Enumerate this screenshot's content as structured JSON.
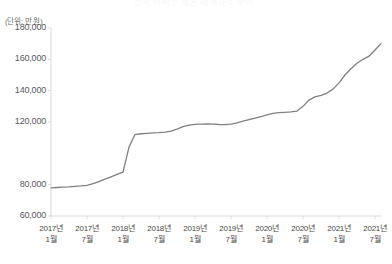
{
  "chart_data": {
    "type": "line",
    "title": "전국 아파트 평균 매매가격 추이",
    "unit_label": "(단위: 만 원)",
    "xlabel": "",
    "ylabel": "",
    "ylim": [
      60000,
      180000
    ],
    "yticks": [
      60000,
      80000,
      120000,
      140000,
      160000,
      180000
    ],
    "ytick_labels": [
      "60,000",
      "80,000",
      "120,000",
      "140,000",
      "160,000",
      "180,000"
    ],
    "grid": false,
    "legend": "none",
    "line_color": "#808080",
    "axis_color": "#d9d9d9",
    "xtick_labels": [
      {
        "year": "2017년",
        "month": "1월"
      },
      {
        "year": "2017년",
        "month": "7월"
      },
      {
        "year": "2018년",
        "month": "1월"
      },
      {
        "year": "2018년",
        "month": "7월"
      },
      {
        "year": "2019년",
        "month": "1월"
      },
      {
        "year": "2019년",
        "month": "7월"
      },
      {
        "year": "2020년",
        "month": "1월"
      },
      {
        "year": "2020년",
        "month": "7월"
      },
      {
        "year": "2021년",
        "month": "1월"
      },
      {
        "year": "2021년",
        "month": "7월"
      }
    ],
    "x": [
      "2017-01",
      "2017-02",
      "2017-03",
      "2017-04",
      "2017-05",
      "2017-06",
      "2017-07",
      "2017-08",
      "2017-09",
      "2017-10",
      "2017-11",
      "2017-12",
      "2018-01",
      "2018-02",
      "2018-03",
      "2018-04",
      "2018-05",
      "2018-06",
      "2018-07",
      "2018-08",
      "2018-09",
      "2018-10",
      "2018-11",
      "2018-12",
      "2019-01",
      "2019-02",
      "2019-03",
      "2019-04",
      "2019-05",
      "2019-06",
      "2019-07",
      "2019-08",
      "2019-09",
      "2019-10",
      "2019-11",
      "2019-12",
      "2020-01",
      "2020-02",
      "2020-03",
      "2020-04",
      "2020-05",
      "2020-06",
      "2020-07",
      "2020-08",
      "2020-09",
      "2020-10",
      "2020-11",
      "2020-12",
      "2021-01",
      "2021-02",
      "2021-03",
      "2021-04",
      "2021-05",
      "2021-06",
      "2021-07",
      "2021-08"
    ],
    "values": [
      78000,
      78200,
      78400,
      78600,
      78900,
      79200,
      79600,
      80600,
      82000,
      83500,
      85000,
      86500,
      88000,
      104000,
      112000,
      112500,
      112800,
      113000,
      113200,
      113500,
      114200,
      115500,
      117000,
      118000,
      118500,
      118700,
      118800,
      118600,
      118400,
      118300,
      118600,
      119500,
      120500,
      121500,
      122500,
      123500,
      124500,
      125500,
      126000,
      126200,
      126400,
      127000,
      130000,
      134000,
      136000,
      137000,
      138500,
      141000,
      145000,
      150000,
      154000,
      157500,
      160000,
      162000,
      166000,
      170000
    ],
    "series": [
      {
        "name": "평균 매매가격",
        "values": [
          78000,
          78200,
          78400,
          78600,
          78900,
          79200,
          79600,
          80600,
          82000,
          83500,
          85000,
          86500,
          88000,
          104000,
          112000,
          112500,
          112800,
          113000,
          113200,
          113500,
          114200,
          115500,
          117000,
          118000,
          118500,
          118700,
          118800,
          118600,
          118400,
          118300,
          118600,
          119500,
          120500,
          121500,
          122500,
          123500,
          124500,
          125500,
          126000,
          126200,
          126400,
          127000,
          130000,
          134000,
          136000,
          137000,
          138500,
          141000,
          145000,
          150000,
          154000,
          157500,
          160000,
          162000,
          166000,
          170000
        ]
      }
    ]
  }
}
